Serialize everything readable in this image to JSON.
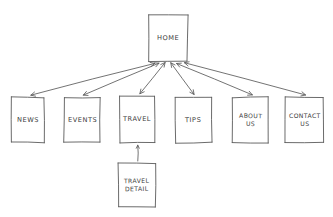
{
  "diagram": {
    "type": "sitemap",
    "style": "hand-drawn pencil on white paper",
    "stroke_color": "#5a5a5a",
    "background_color": "#ffffff",
    "text_color": "#3b3b3b"
  },
  "nodes": [
    {
      "id": "home",
      "label": "Home",
      "x": 147,
      "y": 13,
      "w": 42,
      "h": 50,
      "level": 0
    },
    {
      "id": "news",
      "label": "News",
      "x": 10,
      "y": 96,
      "w": 36,
      "h": 48,
      "level": 1
    },
    {
      "id": "events",
      "label": "Events",
      "x": 63,
      "y": 96,
      "w": 39,
      "h": 48,
      "level": 1
    },
    {
      "id": "travel",
      "label": "Travel",
      "x": 118,
      "y": 95,
      "w": 38,
      "h": 49,
      "level": 1
    },
    {
      "id": "tips",
      "label": "Tips",
      "x": 174,
      "y": 96,
      "w": 39,
      "h": 48,
      "level": 1
    },
    {
      "id": "about-us",
      "label": "About\nUs",
      "x": 231,
      "y": 96,
      "w": 39,
      "h": 48,
      "level": 1
    },
    {
      "id": "contact-us",
      "label": "Contact\nUs",
      "x": 284,
      "y": 96,
      "w": 41,
      "h": 48,
      "level": 1
    },
    {
      "id": "travel-detail",
      "label": "Travel\nDetail",
      "x": 117,
      "y": 162,
      "w": 40,
      "h": 46,
      "level": 2
    }
  ],
  "connections": [
    {
      "id": "home-news",
      "from": "home",
      "to": "news",
      "arrows": "both"
    },
    {
      "id": "home-events",
      "from": "home",
      "to": "events",
      "arrows": "both"
    },
    {
      "id": "home-travel",
      "from": "home",
      "to": "travel",
      "arrows": "both"
    },
    {
      "id": "home-tips",
      "from": "home",
      "to": "tips",
      "arrows": "both"
    },
    {
      "id": "home-about-us",
      "from": "home",
      "to": "about-us",
      "arrows": "both"
    },
    {
      "id": "home-contact-us",
      "from": "home",
      "to": "contact-us",
      "arrows": "both"
    },
    {
      "id": "travel-travel-detail",
      "from": "travel-detail",
      "to": "travel",
      "arrows": "to"
    }
  ]
}
